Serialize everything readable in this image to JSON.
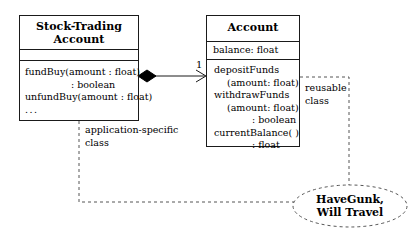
{
  "diagram": {
    "kind": "uml-class-diagram",
    "stroke_color": "#1a1a1a",
    "background": "#ffffff"
  },
  "stock_trading_class": {
    "title_line1": "Stock-Trading",
    "title_line2": "Account",
    "attributes": [],
    "operations": [
      "fundBuy(amount : float)",
      ": boolean",
      "unfundBuy(amount : float)",
      "..."
    ]
  },
  "account_class": {
    "title": "Account",
    "attributes": [
      "balance: float"
    ],
    "operations": [
      "depositFunds",
      "(amount: float)",
      "withdrawFunds",
      "(amount: float)",
      ": boolean",
      "currentBalance( )",
      ": float"
    ]
  },
  "association": {
    "multiplicity": "1",
    "type": "composition"
  },
  "annotations": {
    "app_specific_line1": "application-specific",
    "app_specific_line2": "class",
    "reusable_line1": "reusable",
    "reusable_line2": "class"
  },
  "note_oval": {
    "line1": "HaveGunk,",
    "line2": "Will Travel"
  }
}
